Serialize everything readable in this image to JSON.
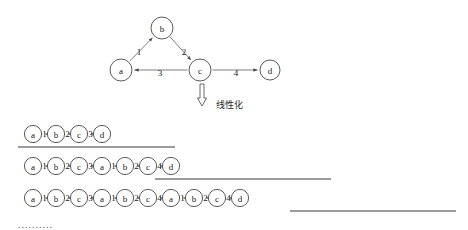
{
  "graph": {
    "nodes": [
      {
        "id": "b",
        "label": "b",
        "cx": 162,
        "cy": 28,
        "r": 11
      },
      {
        "id": "a",
        "label": "a",
        "cx": 121,
        "cy": 70,
        "r": 11
      },
      {
        "id": "c",
        "label": "c",
        "cx": 200,
        "cy": 70,
        "r": 11
      },
      {
        "id": "d",
        "label": "d",
        "cx": 270,
        "cy": 70,
        "r": 10
      }
    ],
    "edges": [
      {
        "from": "a",
        "to": "b",
        "label": "1",
        "label_x": 139,
        "label_y": 52
      },
      {
        "from": "b",
        "to": "c",
        "label": "2",
        "label_x": 184,
        "label_y": 52
      },
      {
        "from": "c",
        "to": "a",
        "label": "3",
        "label_x": 160,
        "label_y": 73
      },
      {
        "from": "c",
        "to": "d",
        "label": "4",
        "label_x": 236,
        "label_y": 73
      }
    ]
  },
  "transform": {
    "label": "线性化",
    "label_x": 216,
    "label_y": 105,
    "arrow_x": 202,
    "arrow_y": 84
  },
  "sequences": [
    {
      "name": "sequence-row-1",
      "y": 134,
      "start_x": 33,
      "items": [
        "a",
        "1",
        "b",
        "2",
        "c",
        "3",
        "d"
      ],
      "underline": {
        "x1": 18,
        "x2": 175,
        "y": 147
      }
    },
    {
      "name": "sequence-row-2",
      "y": 166,
      "start_x": 33,
      "items": [
        "a",
        "1",
        "b",
        "2",
        "c",
        "3",
        "a",
        "1",
        "b",
        "2",
        "c",
        "4",
        "d"
      ],
      "underline": {
        "x1": 155,
        "x2": 331,
        "y": 179
      }
    },
    {
      "name": "sequence-row-3",
      "y": 198,
      "start_x": 33,
      "items": [
        "a",
        "1",
        "b",
        "2",
        "c",
        "3",
        "a",
        "1",
        "b",
        "2",
        "c",
        "4",
        "a",
        "1",
        "b",
        "2",
        "c",
        "4",
        "d"
      ],
      "underline": {
        "x1": 290,
        "x2": 456,
        "y": 211
      }
    }
  ],
  "ellipsis": {
    "text": "..........",
    "x": 18,
    "y": 224
  },
  "colors": {
    "node_stroke": "#4a4a4a",
    "edge_stroke": "#6d6d6d",
    "underline": "#3a3a3a",
    "text": "#1a1a1a",
    "background": "#ffffff"
  }
}
